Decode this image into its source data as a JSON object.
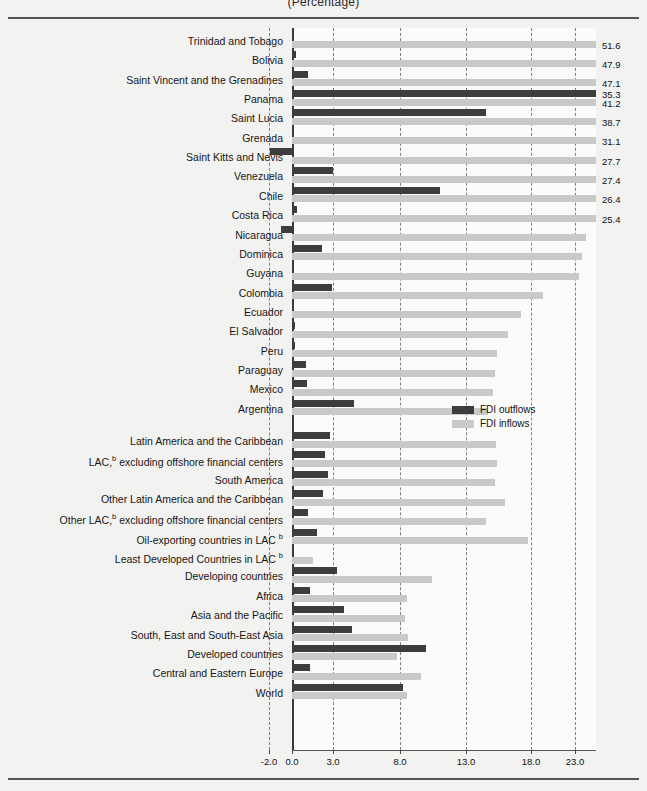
{
  "title": "(Percentage)",
  "legend": {
    "outflows_label": "FDI outflows",
    "inflows_label": "FDI inflows",
    "outflows_color": "#3d3d3d",
    "inflows_color": "#c9c9c7",
    "position": "inside-right-middle"
  },
  "chart_data": {
    "type": "bar",
    "orientation": "horizontal",
    "title": "(Percentage)",
    "xlabel": "",
    "ylabel": "",
    "xlim": [
      -2.0,
      25.4
    ],
    "grid": true,
    "xticks": [
      -2.0,
      0.0,
      3.0,
      8.0,
      13.0,
      18.0,
      23.0
    ],
    "xticklabels": [
      "-2.0",
      "0.0",
      "3.0",
      "8.0",
      "13.0",
      "18.0",
      "23.0"
    ],
    "legend": [
      "FDI outflows",
      "FDI inflows"
    ],
    "note": "Inflow bars exceeding the plotted axis maximum are clipped at the right edge and annotated with their value label.",
    "categories": [
      "Trinidad and Tobago",
      "Bolivia",
      "Saint Vincent and the Grenadines",
      "Panama",
      "Saint Lucia",
      "Grenada",
      "Saint Kitts and Nevis",
      "Venezuela",
      "Chile",
      "Costa Rica",
      "Nicaragua",
      "Dominica",
      "Guyana",
      "Colombia",
      "Ecuador",
      "El Salvador",
      "Peru",
      "Paraguay",
      "Mexico",
      "Argentina",
      "Latin America and the Caribbean",
      "LAC, b excluding offshore financial centers",
      "South America",
      "Other Latin America and the Caribbean",
      "Other  LAC, b excluding offshore financial centers",
      "Oil-exporting countries in  LAC b",
      "Least Developed Countries in LAC b",
      "Developing countries",
      "Africa",
      "Asia and the Pacific",
      "South, East and South-East Asia",
      "Developed countries",
      "Central and Eastern Europe",
      "World"
    ],
    "series": [
      {
        "name": "FDI outflows",
        "color": "#3d3d3d",
        "values": [
          0.1,
          0.3,
          1.2,
          35.3,
          14.5,
          0.0,
          -1.9,
          3.0,
          11.0,
          0.4,
          -1.0,
          2.2,
          0.1,
          2.9,
          0.0,
          0.2,
          0.2,
          1.0,
          1.1,
          4.6,
          2.8,
          2.4,
          2.6,
          2.3,
          1.2,
          1.8,
          0.1,
          3.3,
          1.3,
          3.8,
          4.4,
          10.0,
          1.3,
          8.2
        ]
      },
      {
        "name": "FDI inflows",
        "color": "#c9c9c7",
        "values": [
          51.6,
          47.9,
          47.1,
          41.2,
          38.7,
          31.1,
          27.7,
          27.4,
          26.4,
          25.4,
          24.2,
          23.8,
          23.5,
          19.4,
          17.2,
          16.2,
          15.4,
          15.2,
          15.1,
          14.7,
          15.3,
          15.4,
          15.2,
          16.0,
          14.5,
          17.8,
          1.5,
          10.4,
          8.5,
          8.4,
          8.6,
          7.8,
          9.6,
          8.5
        ]
      }
    ],
    "value_labels": [
      {
        "category": "Trinidad and Tobago",
        "series": "FDI inflows",
        "value": 51.6,
        "text": "51.6"
      },
      {
        "category": "Bolivia",
        "series": "FDI inflows",
        "value": 47.9,
        "text": "47.9"
      },
      {
        "category": "Saint Vincent and the Grenadines",
        "series": "FDI inflows",
        "value": 47.1,
        "text": "47.1"
      },
      {
        "category": "Panama",
        "series": "FDI outflows",
        "value": 35.3,
        "text": "35.3"
      },
      {
        "category": "Panama",
        "series": "FDI inflows",
        "value": 41.2,
        "text": "41.2"
      },
      {
        "category": "Saint Lucia",
        "series": "FDI inflows",
        "value": 38.7,
        "text": "38.7"
      },
      {
        "category": "Grenada",
        "series": "FDI inflows",
        "value": 31.1,
        "text": "31.1"
      },
      {
        "category": "Saint Kitts and Nevis",
        "series": "FDI inflows",
        "value": 27.7,
        "text": "27.7"
      },
      {
        "category": "Venezuela",
        "series": "FDI inflows",
        "value": 27.4,
        "text": "27.4"
      },
      {
        "category": "Chile",
        "series": "FDI inflows",
        "value": 26.4,
        "text": "26.4"
      },
      {
        "category": "Costa Rica",
        "series": "FDI inflows",
        "value": 25.4,
        "text": "25.4"
      }
    ]
  },
  "rows": [
    {
      "label": "Trinidad and Tobago",
      "out": 0.1,
      "in": 51.6,
      "out_lbl": "",
      "in_lbl": "51.6"
    },
    {
      "label": "Bolivia",
      "out": 0.3,
      "in": 47.9,
      "out_lbl": "",
      "in_lbl": "47.9"
    },
    {
      "label": "Saint Vincent and the Grenadines",
      "out": 1.2,
      "in": 47.1,
      "out_lbl": "",
      "in_lbl": "47.1"
    },
    {
      "label": "Panama",
      "out": 35.3,
      "in": 41.2,
      "out_lbl": "35.3",
      "in_lbl": "41.2"
    },
    {
      "label": "Saint Lucia",
      "out": 14.5,
      "in": 38.7,
      "out_lbl": "",
      "in_lbl": "38.7"
    },
    {
      "label": "Grenada",
      "out": 0.0,
      "in": 31.1,
      "out_lbl": "",
      "in_lbl": "31.1"
    },
    {
      "label": "Saint Kitts and Nevis",
      "out": -1.9,
      "in": 27.7,
      "out_lbl": "",
      "in_lbl": "27.7"
    },
    {
      "label": "Venezuela",
      "out": 3.0,
      "in": 27.4,
      "out_lbl": "",
      "in_lbl": "27.4"
    },
    {
      "label": "Chile",
      "out": 11.0,
      "in": 26.4,
      "out_lbl": "",
      "in_lbl": "26.4"
    },
    {
      "label": "Costa Rica",
      "out": 0.4,
      "in": 25.4,
      "out_lbl": "",
      "in_lbl": "25.4"
    },
    {
      "label": "Nicaragua",
      "out": -1.0,
      "in": 24.2,
      "out_lbl": "",
      "in_lbl": ""
    },
    {
      "label": "Dominica",
      "out": 2.2,
      "in": 23.8,
      "out_lbl": "",
      "in_lbl": ""
    },
    {
      "label": "Guyana",
      "out": 0.1,
      "in": 23.5,
      "out_lbl": "",
      "in_lbl": ""
    },
    {
      "label": "Colombia",
      "out": 2.9,
      "in": 19.4,
      "out_lbl": "",
      "in_lbl": ""
    },
    {
      "label": "Ecuador",
      "out": 0.0,
      "in": 17.2,
      "out_lbl": "",
      "in_lbl": ""
    },
    {
      "label": "El Salvador",
      "out": 0.2,
      "in": 16.2,
      "out_lbl": "",
      "in_lbl": ""
    },
    {
      "label": "Peru",
      "out": 0.2,
      "in": 15.4,
      "out_lbl": "",
      "in_lbl": ""
    },
    {
      "label": "Paraguay",
      "out": 1.0,
      "in": 15.2,
      "out_lbl": "",
      "in_lbl": ""
    },
    {
      "label": "Mexico",
      "out": 1.1,
      "in": 15.1,
      "out_lbl": "",
      "in_lbl": ""
    },
    {
      "label": "Argentina",
      "out": 4.6,
      "in": 14.7,
      "out_lbl": "",
      "in_lbl": ""
    },
    {
      "label": "Latin America and the Caribbean",
      "out": 2.8,
      "in": 15.3,
      "out_lbl": "",
      "in_lbl": "",
      "gap": true
    },
    {
      "label": "LAC,|b| excluding offshore financial centers",
      "out": 2.4,
      "in": 15.4,
      "out_lbl": "",
      "in_lbl": ""
    },
    {
      "label": "South America",
      "out": 2.6,
      "in": 15.2,
      "out_lbl": "",
      "in_lbl": ""
    },
    {
      "label": "Other Latin America and the Caribbean",
      "out": 2.3,
      "in": 16.0,
      "out_lbl": "",
      "in_lbl": ""
    },
    {
      "label": "Other  LAC,|b| excluding offshore financial centers",
      "out": 1.2,
      "in": 14.5,
      "out_lbl": "",
      "in_lbl": ""
    },
    {
      "label": "Oil-exporting countries in  LAC |b|",
      "out": 1.8,
      "in": 17.8,
      "out_lbl": "",
      "in_lbl": ""
    },
    {
      "label": "Least Developed Countries in LAC |b|",
      "out": 0.1,
      "in": 1.5,
      "out_lbl": "",
      "in_lbl": ""
    },
    {
      "label": "Developing countries",
      "out": 3.3,
      "in": 10.4,
      "out_lbl": "",
      "in_lbl": ""
    },
    {
      "label": "Africa",
      "out": 1.3,
      "in": 8.5,
      "out_lbl": "",
      "in_lbl": ""
    },
    {
      "label": "Asia and the Pacific",
      "out": 3.8,
      "in": 8.4,
      "out_lbl": "",
      "in_lbl": ""
    },
    {
      "label": "South, East and South-East Asia",
      "out": 4.4,
      "in": 8.6,
      "out_lbl": "",
      "in_lbl": ""
    },
    {
      "label": "Developed countries",
      "out": 10.0,
      "in": 7.8,
      "out_lbl": "",
      "in_lbl": ""
    },
    {
      "label": "Central and Eastern Europe",
      "out": 1.3,
      "in": 9.6,
      "out_lbl": "",
      "in_lbl": ""
    },
    {
      "label": "World",
      "out": 8.2,
      "in": 8.5,
      "out_lbl": "",
      "in_lbl": ""
    }
  ],
  "axis": {
    "ticks": [
      {
        "value": -2.0,
        "label": "-2.0",
        "px": 269
      },
      {
        "value": 0.0,
        "label": "0.0",
        "px": 292
      },
      {
        "value": 3.0,
        "label": "3.0",
        "px": 333
      },
      {
        "value": 8.0,
        "label": "8.0",
        "px": 400
      },
      {
        "value": 13.0,
        "label": "13.0",
        "px": 466
      },
      {
        "value": 18.0,
        "label": "18.0",
        "px": 531
      },
      {
        "value": 23.0,
        "label": "23.0",
        "px": 575
      }
    ]
  }
}
